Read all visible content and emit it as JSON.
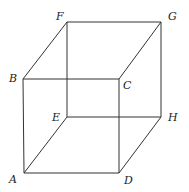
{
  "diagram": {
    "type": "cube-wireframe",
    "vertices": {
      "A": {
        "label": "A",
        "x": 24,
        "y": 173
      },
      "B": {
        "label": "B",
        "x": 23,
        "y": 79
      },
      "C": {
        "label": "C",
        "x": 119,
        "y": 79
      },
      "D": {
        "label": "D",
        "x": 119,
        "y": 173
      },
      "E": {
        "label": "E",
        "x": 67,
        "y": 117
      },
      "F": {
        "label": "F",
        "x": 67,
        "y": 22
      },
      "G": {
        "label": "G",
        "x": 161,
        "y": 22
      },
      "H": {
        "label": "H",
        "x": 161,
        "y": 117
      }
    },
    "edges": [
      [
        "A",
        "B"
      ],
      [
        "B",
        "C"
      ],
      [
        "C",
        "D"
      ],
      [
        "D",
        "A"
      ],
      [
        "E",
        "F"
      ],
      [
        "F",
        "G"
      ],
      [
        "G",
        "H"
      ],
      [
        "H",
        "E"
      ],
      [
        "A",
        "E"
      ],
      [
        "B",
        "F"
      ],
      [
        "C",
        "G"
      ],
      [
        "D",
        "H"
      ]
    ]
  }
}
